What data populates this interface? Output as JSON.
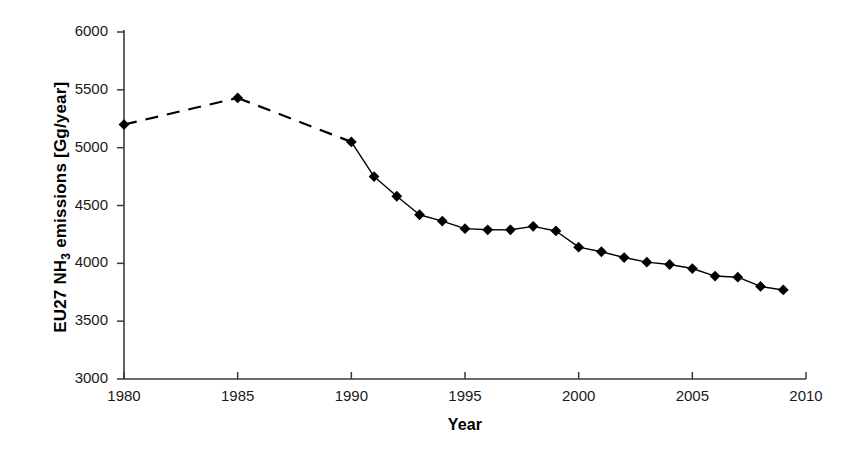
{
  "chart_data": {
    "type": "line",
    "title": "",
    "subtitle": "",
    "xlabel": "Year",
    "ylabel_text": "EU27 NH",
    "ylabel_sub": "3",
    "ylabel_rest": " emissions [Gg/year]",
    "ylabel_full": "EU27 NH3 emissions [Gg/year]",
    "xlim": [
      1980,
      2010
    ],
    "ylim": [
      3000,
      6000
    ],
    "xticks": [
      1980,
      1985,
      1990,
      1995,
      2000,
      2005,
      2010
    ],
    "yticks": [
      3000,
      3500,
      4000,
      4500,
      5000,
      5500,
      6000
    ],
    "grid": false,
    "legend": "none",
    "marker": "diamond",
    "marker_color": "#000000",
    "line_color": "#000000",
    "series": [
      {
        "name": "EU27 NH3 emissions",
        "x": [
          1980,
          1985,
          1990,
          1991,
          1992,
          1993,
          1994,
          1995,
          1996,
          1997,
          1998,
          1999,
          2000,
          2001,
          2002,
          2003,
          2004,
          2005,
          2006,
          2007,
          2008,
          2009
        ],
        "values": [
          5200,
          5430,
          5050,
          4750,
          4580,
          4420,
          4365,
          4300,
          4290,
          4290,
          4320,
          4280,
          4140,
          4100,
          4050,
          4010,
          3990,
          3955,
          3890,
          3880,
          3800,
          3770
        ],
        "dashed_segments": [
          [
            1980,
            1985
          ],
          [
            1985,
            1990
          ]
        ]
      }
    ]
  }
}
